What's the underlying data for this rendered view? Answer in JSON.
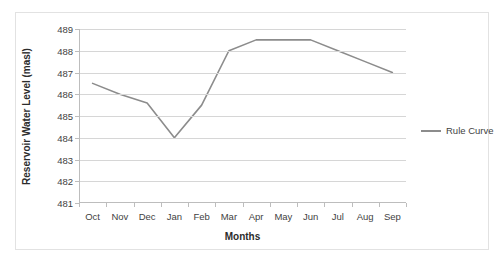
{
  "chart_data": {
    "type": "line",
    "title": "",
    "xlabel": "Months",
    "ylabel": "Reservoir Water Level (masl)",
    "categories": [
      "Oct",
      "Nov",
      "Dec",
      "Jan",
      "Feb",
      "Mar",
      "Apr",
      "May",
      "Jun",
      "Jul",
      "Aug",
      "Sep"
    ],
    "ylim": [
      481,
      489
    ],
    "yticks": [
      481,
      482,
      483,
      484,
      485,
      486,
      487,
      488,
      489
    ],
    "grid": true,
    "legend_position": "right",
    "series": [
      {
        "name": "Rule Curve",
        "color": "#8c8c8c",
        "values": [
          486.5,
          486.0,
          485.6,
          484.0,
          485.5,
          488.0,
          488.5,
          488.5,
          488.5,
          488.0,
          487.5,
          487.0
        ]
      }
    ]
  },
  "legend": {
    "entries": [
      {
        "label": "Rule Curve",
        "color": "#8c8c8c"
      }
    ]
  }
}
